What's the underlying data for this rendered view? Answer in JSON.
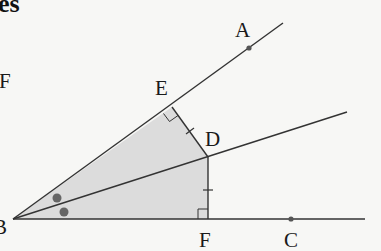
{
  "heading_fragment": "es",
  "side_label": "F",
  "colors": {
    "background": "#f7f7f5",
    "line": "#333333",
    "shade": "#dcdcdc",
    "point": "#555555",
    "angle_marker": "#666666"
  },
  "points": {
    "B": {
      "label": "B",
      "x": 13,
      "y": 219
    },
    "F": {
      "label": "F",
      "x": 208,
      "y": 219
    },
    "C": {
      "label": "C",
      "x": 291,
      "y": 219
    },
    "D": {
      "label": "D",
      "x": 208,
      "y": 157
    },
    "E": {
      "label": "E",
      "x": 172,
      "y": 107
    },
    "A": {
      "label": "A",
      "x": 249,
      "y": 48
    }
  },
  "rays": [
    {
      "name": "BA",
      "from": "B",
      "to": [
        283,
        23
      ]
    },
    {
      "name": "BD",
      "from": "B",
      "to": [
        347,
        112
      ]
    },
    {
      "name": "BC",
      "from": "B",
      "to": [
        365,
        219
      ]
    }
  ],
  "segments": [
    {
      "name": "DE",
      "from": "D",
      "to": "E",
      "tick_marks": 1
    },
    {
      "name": "DF",
      "from": "D",
      "to": "F",
      "tick_marks": 1
    }
  ],
  "right_angles": [
    "E",
    "F"
  ],
  "equal_angle_markers": 2,
  "shaded_region": [
    "B",
    "E",
    "D",
    "F"
  ]
}
